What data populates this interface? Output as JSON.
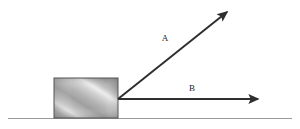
{
  "figure": {
    "canvas": {
      "width": 300,
      "height": 129,
      "background": "#ffffff"
    }
  },
  "ground": {
    "name": "ground-surface-line",
    "x1": 8,
    "y1": 118.5,
    "x2": 292,
    "y2": 118.5,
    "color": "#9a9a9a",
    "thickness": 1.2
  },
  "block": {
    "name": "block",
    "x": 54,
    "y": 78,
    "width": 64,
    "height": 40,
    "border_color": "#555555",
    "fill_light": "#d8d8d8",
    "fill_mid": "#a8a8a8",
    "fill_dark": "#7e7e7e",
    "texture": "diagonal-brushed-metal"
  },
  "vectors": [
    {
      "id": "A",
      "name": "force-vector-a",
      "label": "A",
      "label_x": 165,
      "label_y": 41,
      "origin_x": 118,
      "origin_y": 99,
      "tip_x": 227,
      "tip_y": 12,
      "angle_degrees": 38.6,
      "color": "#2f2f2f",
      "thickness": 2
    },
    {
      "id": "B",
      "name": "force-vector-b",
      "label": "B",
      "label_x": 192,
      "label_y": 91,
      "origin_x": 118,
      "origin_y": 99,
      "tip_x": 258,
      "tip_y": 99,
      "angle_degrees": 0,
      "color": "#2f2f2f",
      "thickness": 2
    }
  ],
  "colors": {
    "stroke": "#2f2f2f",
    "ground": "#9a9a9a",
    "background": "#ffffff",
    "label": "#1c1c1c"
  }
}
